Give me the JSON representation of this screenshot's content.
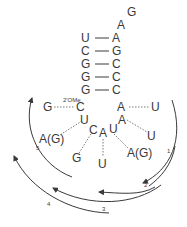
{
  "diagram": {
    "loop_top": [
      {
        "label": "G",
        "x": 130,
        "y": 15
      },
      {
        "label": "A",
        "x": 121,
        "y": 28
      }
    ],
    "stem_pairs": [
      {
        "left": "U",
        "right": "A",
        "y": 42
      },
      {
        "left": "C",
        "right": "G",
        "y": 55
      },
      {
        "left": "G",
        "right": "C",
        "y": 68
      },
      {
        "left": "G",
        "right": "C",
        "y": 81
      },
      {
        "left": "G",
        "right": "C",
        "y": 94
      }
    ],
    "modification_label": "2'OMe",
    "loop_nucleotides": [
      {
        "id": "g-left",
        "label": "G",
        "x": 47,
        "y": 111
      },
      {
        "id": "c-2ome",
        "label": "C",
        "x": 81,
        "y": 111
      },
      {
        "id": "a-right",
        "label": "A",
        "x": 121,
        "y": 111
      },
      {
        "id": "u-far-right",
        "label": "U",
        "x": 155,
        "y": 111
      },
      {
        "id": "u-inner-left",
        "label": "U",
        "x": 84,
        "y": 124
      },
      {
        "id": "c-inner",
        "label": "C",
        "x": 93,
        "y": 133
      },
      {
        "id": "a-center",
        "label": "A",
        "x": 103,
        "y": 137
      },
      {
        "id": "u-inner-right",
        "label": "U",
        "x": 113,
        "y": 132
      },
      {
        "id": "a-inner-right",
        "label": "A",
        "x": 122,
        "y": 122
      },
      {
        "id": "ag-left",
        "label": "A(G)",
        "x": 47,
        "y": 141
      },
      {
        "id": "u-right",
        "label": "U",
        "x": 151,
        "y": 139
      },
      {
        "id": "ag-right",
        "label": "A(G)",
        "x": 136,
        "y": 156
      },
      {
        "id": "g-bottom",
        "label": "G",
        "x": 76,
        "y": 161
      },
      {
        "id": "u-bottom",
        "label": "U",
        "x": 102,
        "y": 166
      }
    ],
    "arrows": [
      {
        "number": "1"
      },
      {
        "number": "2"
      },
      {
        "number": "3"
      },
      {
        "number": "4"
      },
      {
        "number": "5"
      }
    ]
  }
}
